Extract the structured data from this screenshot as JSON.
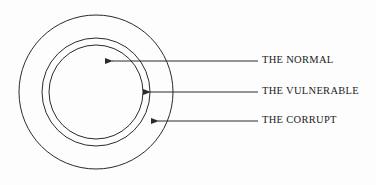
{
  "diagram": {
    "type": "concentric-circles",
    "rings": [
      {
        "name": "inner",
        "represents": "THE NORMAL"
      },
      {
        "name": "middle",
        "represents": "THE VULNERABLE"
      },
      {
        "name": "outer",
        "represents": "THE CORRUPT"
      }
    ],
    "labels": [
      {
        "id": "normal",
        "text": "THE NORMAL"
      },
      {
        "id": "vulnerable",
        "text": "THE VULNERABLE"
      },
      {
        "id": "corrupt",
        "text": "THE CORRUPT"
      }
    ],
    "colors": {
      "line": "#2a2a2a",
      "background": "#fdfdfd"
    }
  }
}
